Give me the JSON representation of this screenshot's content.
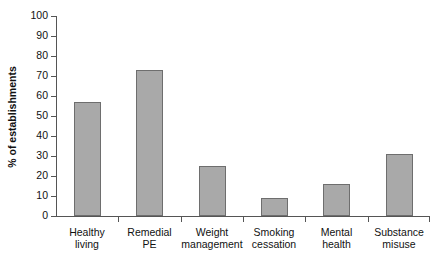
{
  "chart_data": {
    "type": "bar",
    "title": "",
    "xlabel": "",
    "ylabel": "% of establishments",
    "ylim": [
      0,
      100
    ],
    "yticks": [
      "0",
      "10",
      "20",
      "30",
      "40",
      "50",
      "60",
      "70",
      "80",
      "90",
      "100"
    ],
    "grid": false,
    "legend": "none",
    "categories": [
      "Healthy living",
      "Remedial PE",
      "Weight management",
      "Smoking cessation",
      "Mental health",
      "Substance misuse"
    ],
    "category_lines": [
      [
        "Healthy",
        "living"
      ],
      [
        "Remedial",
        "PE"
      ],
      [
        "Weight",
        "management"
      ],
      [
        "Smoking",
        "cessation"
      ],
      [
        "Mental",
        "health"
      ],
      [
        "Substance",
        "misuse"
      ]
    ],
    "values": [
      57,
      73,
      25,
      9,
      16,
      31
    ],
    "bar_color": "#a9a9a9",
    "bar_edge_color": "#6e6e6e",
    "axis_color": "#555555"
  }
}
